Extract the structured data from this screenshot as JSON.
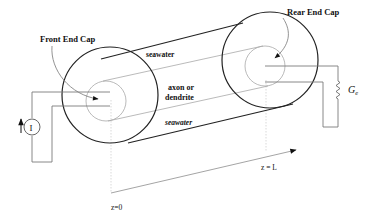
{
  "diagram": {
    "labels": {
      "front_end_cap": "Front End Cap",
      "rear_end_cap": "Rear End Cap",
      "seawater_top": "seawater",
      "seawater_bottom": "seawater",
      "axon_line1": "axon or",
      "axon_line2": "dendrite",
      "current_source": "I",
      "conductance_symbol": "G",
      "conductance_subscript": "e",
      "z_start": "z=0",
      "z_end": "z = L"
    },
    "colors": {
      "outer_cylinder": "#222222",
      "inner_cylinder": "#9a9a9a",
      "wires": "#7a7a7a",
      "axis": "#9a9a9a",
      "text": "#111111"
    }
  }
}
